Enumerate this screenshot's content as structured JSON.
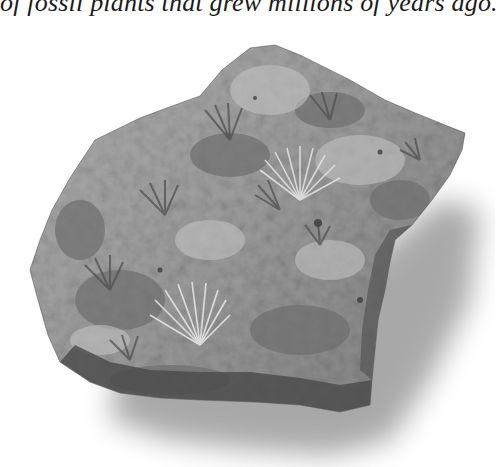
{
  "caption": {
    "text": "of fossil plants that grew millions of years ago."
  },
  "figure": {
    "colors": {
      "background": "#ffffff",
      "rock_base": "#9a9a9a",
      "rock_light": "#c4c4c4",
      "rock_dark": "#555555",
      "fossil_highlight": "#dedede",
      "shadow": "#8c8c8c",
      "text": "#1a1a1a"
    }
  }
}
